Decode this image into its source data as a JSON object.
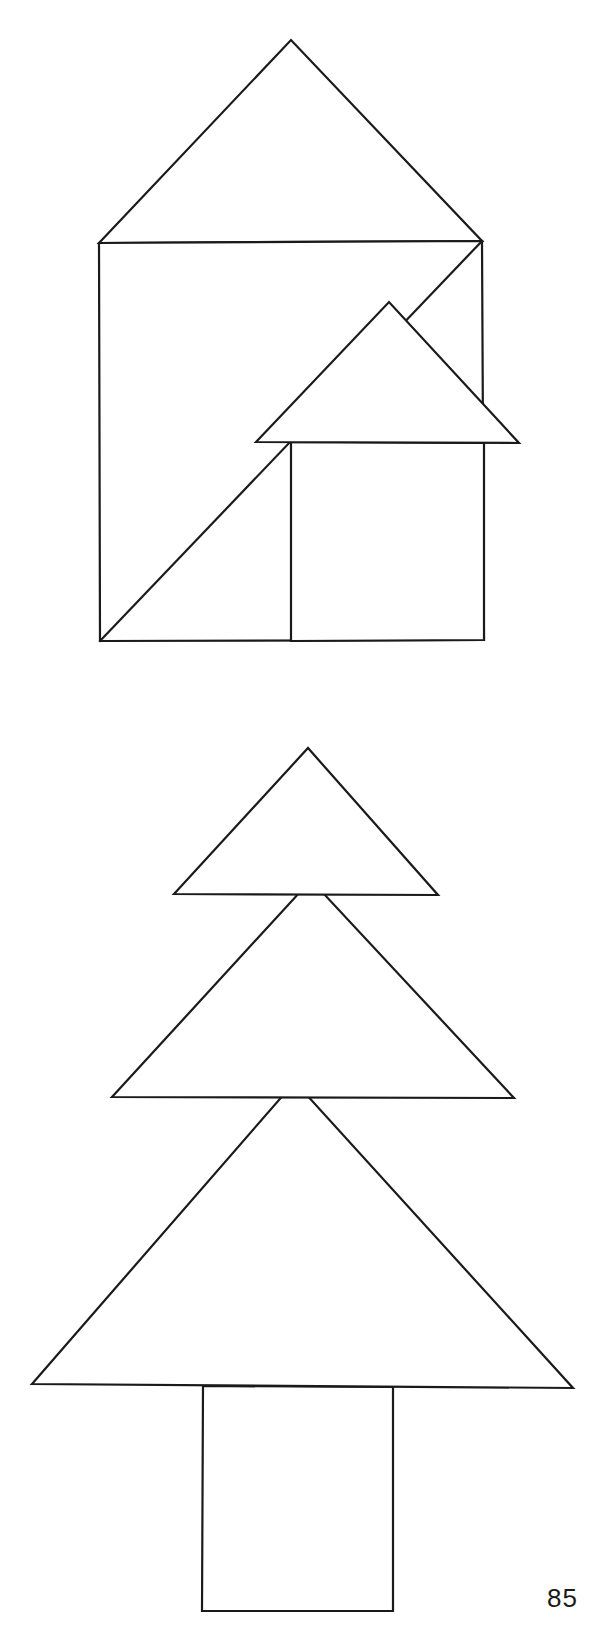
{
  "page": {
    "width": 608,
    "height": 1631,
    "background": "#ffffff",
    "ink_color": "#1a1a1a",
    "page_number": "85"
  },
  "figures": [
    {
      "name": "two-houses-figure",
      "shapes": [
        {
          "name": "big-house-roof-triangle",
          "type": "polygon",
          "points": "99,243 291,40 482,241"
        },
        {
          "name": "big-house-square",
          "type": "polygon",
          "points": "99,243 482,241 484,640 100,641"
        },
        {
          "name": "big-house-diagonal",
          "type": "line",
          "points": "100,641 482,241"
        },
        {
          "name": "small-house-body",
          "type": "polygon",
          "points": "291,442 484,443 484,640 291,641"
        },
        {
          "name": "small-house-roof-triangle",
          "type": "polygon",
          "points": "256,442 389,302 519,443"
        }
      ]
    },
    {
      "name": "tree-figure",
      "shapes": [
        {
          "name": "tree-trunk",
          "type": "polygon",
          "points": "203,1386 393,1387 393,1611 202,1611"
        },
        {
          "name": "tree-bottom-triangle",
          "type": "polygon",
          "points": "32,1384 285,1093 305,1093 573,1388"
        },
        {
          "name": "tree-middle-triangle",
          "type": "polygon",
          "points": "112,1097 311,880 514,1098"
        },
        {
          "name": "tree-top-triangle",
          "type": "polygon",
          "points": "174,894 308,748 438,895"
        }
      ]
    }
  ]
}
